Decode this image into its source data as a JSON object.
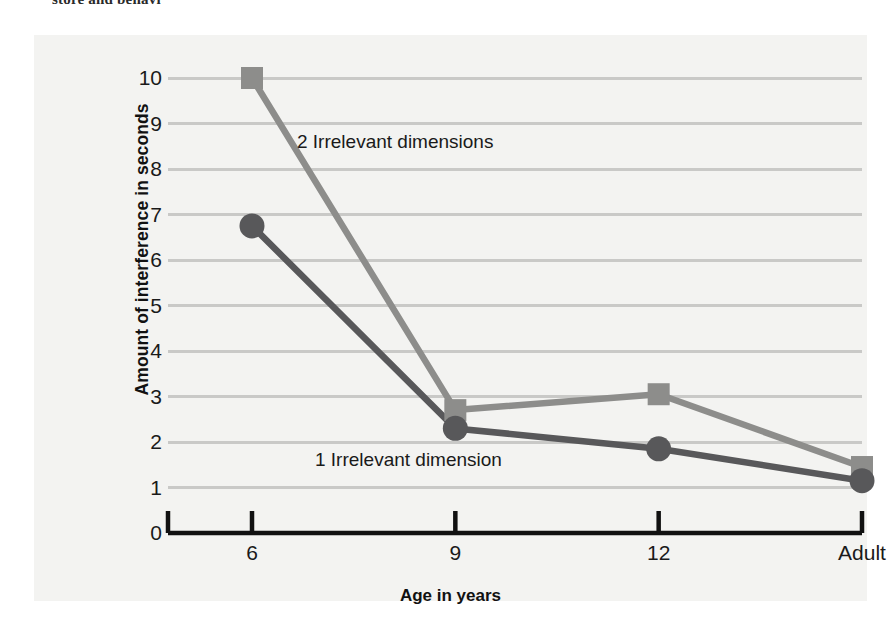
{
  "top_fragment": "store and behavi",
  "chart_data": {
    "type": "line",
    "title": "",
    "xlabel": "Age in years",
    "ylabel": "Amount of interference in seconds",
    "categories": [
      "6",
      "9",
      "12",
      "Adult"
    ],
    "ylim": [
      0,
      10
    ],
    "yticks": [
      10,
      9,
      8,
      7,
      6,
      5,
      4,
      3,
      2,
      1,
      0
    ],
    "grid": true,
    "legend_position": "inline-annotations",
    "series": [
      {
        "name": "2 Irrelevant dimensions",
        "marker": "square",
        "color": "#8d8d8b",
        "values": [
          10.0,
          2.7,
          3.05,
          1.45
        ]
      },
      {
        "name": "1 Irrelevant dimension",
        "marker": "circle",
        "color": "#58585a",
        "values": [
          6.75,
          2.3,
          1.85,
          1.15
        ]
      }
    ],
    "annotations": [
      {
        "text": "2 Irrelevant dimensions",
        "series": "2 Irrelevant dimensions"
      },
      {
        "text": "1 Irrelevant dimension",
        "series": "1 Irrelevant dimension"
      }
    ]
  },
  "colors": {
    "panel_background": "#f3f3f1",
    "gridline": "#c9c9c7",
    "axis": "#111111",
    "series_two_irrelevant": "#8d8d8b",
    "series_one_irrelevant": "#58585a"
  }
}
